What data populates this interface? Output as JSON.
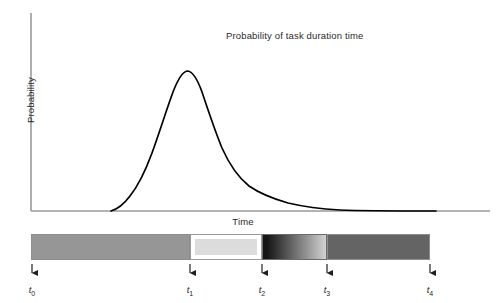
{
  "figure": {
    "title": "Probability of task duration time",
    "ylabel": "Probability",
    "xlabel": "Time",
    "curve_color": "#000000",
    "axis_color": "#9a9a9a"
  },
  "ticks": [
    {
      "label": "t",
      "index": "0",
      "x": 32
    },
    {
      "label": "t",
      "index": "1",
      "x": 190
    },
    {
      "label": "t",
      "index": "2",
      "x": 262
    },
    {
      "label": "t",
      "index": "3",
      "x": 327
    },
    {
      "label": "t",
      "index": "4",
      "x": 430
    }
  ],
  "timeline": {
    "segments": [
      {
        "name": "segment-t0-t1",
        "style": "solid",
        "fill": "#969696",
        "x": 0,
        "width": 159
      },
      {
        "name": "segment-t1-t2",
        "style": "inset",
        "fill": "#dcdcdc",
        "x": 159,
        "width": 72
      },
      {
        "name": "segment-t2-t3",
        "style": "gradient-dark-to-light",
        "fill": "#141414",
        "fill2": "#d2d2d2",
        "x": 231,
        "width": 65
      },
      {
        "name": "segment-t3-t4",
        "style": "solid",
        "fill": "#646464",
        "x": 296,
        "width": 103
      }
    ]
  },
  "chart_data": {
    "type": "line",
    "title": "Probability of task duration time",
    "xlabel": "Time",
    "ylabel": "Probability",
    "grid": false,
    "legend": null,
    "xlim": [
      0,
      1
    ],
    "ylim": [
      0,
      1
    ],
    "annotations": [
      "t0",
      "t1",
      "t2",
      "t3",
      "t4"
    ],
    "series": [
      {
        "name": "task duration probability density",
        "x": [
          0.2,
          0.24,
          0.28,
          0.31,
          0.34,
          0.37,
          0.4,
          0.43,
          0.46,
          0.49,
          0.52,
          0.55,
          0.58,
          0.62,
          0.66,
          0.7,
          0.74,
          0.78,
          0.82,
          0.86,
          0.9,
          0.94,
          0.98
        ],
        "y": [
          0.0,
          0.03,
          0.09,
          0.17,
          0.3,
          0.48,
          0.69,
          0.88,
          0.99,
          1.0,
          0.94,
          0.83,
          0.71,
          0.56,
          0.45,
          0.36,
          0.29,
          0.23,
          0.17,
          0.12,
          0.07,
          0.03,
          0.0
        ]
      }
    ]
  }
}
